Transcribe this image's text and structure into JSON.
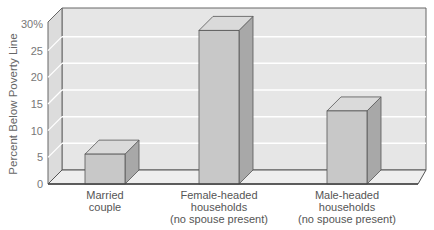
{
  "chart_data": {
    "type": "bar",
    "style": "3d",
    "title": "",
    "xlabel": "",
    "ylabel": "Percent Below Poverty Line",
    "ylim": [
      0,
      30
    ],
    "yticks": [
      "0",
      "5",
      "10",
      "15",
      "20",
      "25",
      "30%"
    ],
    "categories": [
      "Married couple",
      "Female-headed households (no spouse present)",
      "Male-headed households (no spouse present)"
    ],
    "category_lines": [
      [
        "Married",
        "couple"
      ],
      [
        "Female-headed",
        "households",
        "(no spouse present)"
      ],
      [
        "Male-headed",
        "households",
        "(no spouse present)"
      ]
    ],
    "values": [
      5.6,
      28.8,
      13.7
    ],
    "grid": true,
    "legend": null,
    "colors": {
      "wall": "#e6e6e6",
      "side_wall": "#dcdcdc",
      "floor": "#eeeeee",
      "grid": "#ffffff",
      "bar_front": "#c8c8c8",
      "bar_top": "#dadada",
      "bar_side": "#a8a8a8",
      "outline": "#555555"
    }
  }
}
